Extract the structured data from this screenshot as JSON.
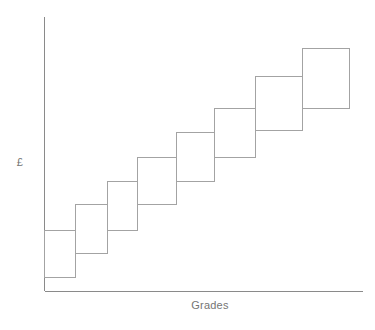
{
  "figure": {
    "background": "#ffffff",
    "axis_color": "#8a8a8a",
    "box_border_color": "#a3a3a3",
    "label_color": "#757575",
    "ylabel": "£",
    "xlabel": "Grades"
  },
  "chart_data": {
    "type": "bar",
    "subtype": "overlapping-pay-range-boxes",
    "title": "",
    "xlabel": "Grades",
    "ylabel": "£",
    "x_tick_labels": [],
    "y_tick_labels": [],
    "categories": [
      1,
      2,
      3,
      4,
      5,
      6,
      7,
      8
    ],
    "series": [
      {
        "name": "pay-range-per-grade",
        "ranges_pct_of_axis": [
          [
            5,
            22
          ],
          [
            14,
            32
          ],
          [
            22,
            40
          ],
          [
            32,
            49
          ],
          [
            40,
            58
          ],
          [
            49,
            67
          ],
          [
            59,
            78
          ],
          [
            67,
            89
          ]
        ]
      }
    ],
    "legend": null,
    "grid": false,
    "axes_px": {
      "y_axis": {
        "x": 44.5,
        "y1": 17,
        "y2": 291
      },
      "x_axis": {
        "y": 291,
        "x1": 44.5,
        "x2": 363
      }
    },
    "boxes_px": [
      {
        "x": 44.5,
        "y": 230,
        "w": 30.5,
        "h": 47
      },
      {
        "x": 75,
        "y": 204,
        "w": 32,
        "h": 49
      },
      {
        "x": 107,
        "y": 181,
        "w": 30.5,
        "h": 49
      },
      {
        "x": 137.5,
        "y": 157,
        "w": 39,
        "h": 47
      },
      {
        "x": 176.5,
        "y": 132,
        "w": 38,
        "h": 49
      },
      {
        "x": 214.5,
        "y": 108,
        "w": 40.5,
        "h": 49
      },
      {
        "x": 255,
        "y": 76,
        "w": 47,
        "h": 54
      },
      {
        "x": 302,
        "y": 48,
        "w": 47.5,
        "h": 60
      }
    ]
  }
}
